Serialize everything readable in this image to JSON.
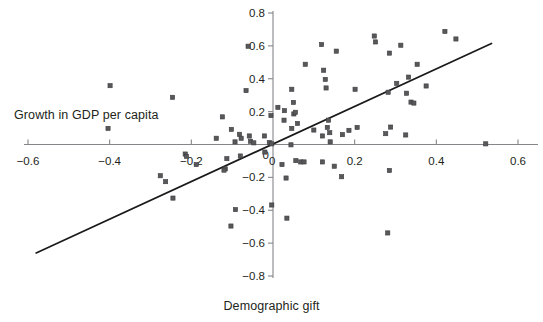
{
  "chart_data": {
    "type": "scatter",
    "title": "",
    "xlabel": "Demographic gift",
    "ylabel": "Growth in GDP per capita",
    "xlim": [
      -0.6,
      0.6
    ],
    "ylim": [
      -0.8,
      0.8
    ],
    "grid": false,
    "legend": null,
    "x_ticks": [
      -0.6,
      -0.4,
      -0.2,
      0,
      0.2,
      0.4,
      0.6
    ],
    "x_tick_labels": [
      "−0.6",
      "−0.4",
      "−0.2",
      "0",
      "0.2",
      "0.4",
      "0.6"
    ],
    "y_ticks": [
      -0.8,
      -0.6,
      -0.4,
      -0.2,
      0,
      0.2,
      0.4,
      0.6,
      0.8
    ],
    "y_tick_labels": [
      "−0.8",
      "−0.6",
      "−0.4",
      "−0.2",
      "0",
      "0.2",
      "0.4",
      "0.6",
      "0.8"
    ],
    "marker": "square",
    "marker_color": "#58585b",
    "trend_line": {
      "color": "#1a1a1a",
      "x_start": -0.58,
      "y_start": -0.66,
      "x_end": 0.535,
      "y_end": 0.615
    },
    "points": [
      {
        "x": -0.399,
        "y": 0.358
      },
      {
        "x": -0.246,
        "y": 0.287
      },
      {
        "x": -0.404,
        "y": 0.098
      },
      {
        "x": -0.124,
        "y": 0.168
      },
      {
        "x": -0.061,
        "y": 0.598
      },
      {
        "x": -0.066,
        "y": 0.328
      },
      {
        "x": -0.005,
        "y": 0.176
      },
      {
        "x": -0.139,
        "y": 0.038
      },
      {
        "x": -0.102,
        "y": 0.092
      },
      {
        "x": -0.093,
        "y": 0.016
      },
      {
        "x": -0.082,
        "y": 0.062
      },
      {
        "x": -0.078,
        "y": 0.038
      },
      {
        "x": -0.058,
        "y": 0.052
      },
      {
        "x": -0.055,
        "y": 0.02
      },
      {
        "x": -0.047,
        "y": 0.01
      },
      {
        "x": -0.021,
        "y": 0.052
      },
      {
        "x": -0.009,
        "y": 0.012
      },
      {
        "x": -0.003,
        "y": 0.004
      },
      {
        "x": 0.012,
        "y": 0.226
      },
      {
        "x": 0.028,
        "y": 0.206
      },
      {
        "x": 0.027,
        "y": 0.148
      },
      {
        "x": 0.046,
        "y": 0.336
      },
      {
        "x": 0.05,
        "y": 0.256
      },
      {
        "x": 0.051,
        "y": 0.186
      },
      {
        "x": 0.055,
        "y": 0.196
      },
      {
        "x": 0.06,
        "y": 0.128
      },
      {
        "x": 0.046,
        "y": 0.098
      },
      {
        "x": 0.079,
        "y": 0.488
      },
      {
        "x": 0.1,
        "y": 0.088
      },
      {
        "x": 0.119,
        "y": 0.608
      },
      {
        "x": 0.124,
        "y": 0.452
      },
      {
        "x": 0.128,
        "y": 0.396
      },
      {
        "x": 0.13,
        "y": 0.344
      },
      {
        "x": 0.136,
        "y": 0.148
      },
      {
        "x": 0.133,
        "y": 0.104
      },
      {
        "x": 0.139,
        "y": 0.072
      },
      {
        "x": 0.14,
        "y": 0.016
      },
      {
        "x": 0.121,
        "y": 0.052
      },
      {
        "x": 0.155,
        "y": 0.568
      },
      {
        "x": 0.17,
        "y": 0.06
      },
      {
        "x": 0.186,
        "y": 0.086
      },
      {
        "x": 0.201,
        "y": 0.336
      },
      {
        "x": 0.206,
        "y": 0.104
      },
      {
        "x": 0.248,
        "y": 0.66
      },
      {
        "x": 0.251,
        "y": 0.624
      },
      {
        "x": 0.285,
        "y": 0.556
      },
      {
        "x": 0.282,
        "y": 0.318
      },
      {
        "x": 0.276,
        "y": 0.066
      },
      {
        "x": 0.288,
        "y": 0.106
      },
      {
        "x": 0.303,
        "y": 0.372
      },
      {
        "x": 0.313,
        "y": 0.604
      },
      {
        "x": 0.332,
        "y": 0.41
      },
      {
        "x": 0.327,
        "y": 0.312
      },
      {
        "x": 0.338,
        "y": 0.258
      },
      {
        "x": 0.345,
        "y": 0.252
      },
      {
        "x": 0.325,
        "y": 0.058
      },
      {
        "x": 0.353,
        "y": 0.488
      },
      {
        "x": 0.375,
        "y": 0.356
      },
      {
        "x": 0.421,
        "y": 0.688
      },
      {
        "x": 0.448,
        "y": 0.642
      },
      {
        "x": 0.521,
        "y": 0.004
      },
      {
        "x": -0.215,
        "y": -0.058
      },
      {
        "x": -0.212,
        "y": -0.072
      },
      {
        "x": -0.188,
        "y": -0.122
      },
      {
        "x": -0.117,
        "y": -0.148
      },
      {
        "x": -0.12,
        "y": -0.156
      },
      {
        "x": -0.113,
        "y": -0.086
      },
      {
        "x": -0.08,
        "y": -0.07
      },
      {
        "x": -0.276,
        "y": -0.19
      },
      {
        "x": -0.263,
        "y": -0.226
      },
      {
        "x": -0.245,
        "y": -0.326
      },
      {
        "x": -0.02,
        "y": -0.046
      },
      {
        "x": 0.022,
        "y": -0.122
      },
      {
        "x": 0.032,
        "y": -0.204
      },
      {
        "x": 0.044,
        "y": -0.002
      },
      {
        "x": 0.056,
        "y": -0.098
      },
      {
        "x": 0.068,
        "y": -0.106
      },
      {
        "x": 0.076,
        "y": -0.106
      },
      {
        "x": 0.121,
        "y": -0.106
      },
      {
        "x": 0.15,
        "y": -0.132
      },
      {
        "x": 0.168,
        "y": -0.196
      },
      {
        "x": 0.285,
        "y": -0.158
      },
      {
        "x": -0.003,
        "y": -0.368
      },
      {
        "x": 0.034,
        "y": -0.448
      },
      {
        "x": -0.092,
        "y": -0.396
      },
      {
        "x": -0.103,
        "y": -0.496
      },
      {
        "x": 0.281,
        "y": -0.538
      }
    ]
  },
  "axis": {
    "x_title": "Demographic gift",
    "y_title": "Growth in GDP per capita"
  }
}
